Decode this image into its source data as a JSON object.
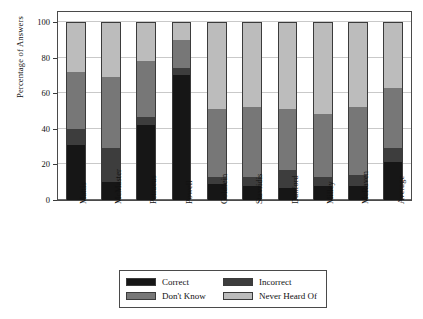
{
  "chart_data": {
    "type": "bar",
    "subtype": "stacked-bar-100",
    "title": "",
    "xlabel": "",
    "ylabel": "Percentage of Answers",
    "ylim": [
      0,
      100
    ],
    "yticks": [
      0,
      20,
      40,
      60,
      80,
      100
    ],
    "ytick_labels": [
      "0",
      "20",
      "40",
      "60",
      "80",
      "100"
    ],
    "grid": true,
    "legend_position": "bottom",
    "categories": [
      "Mattis",
      "McMaster",
      "Petraeus",
      "Powell",
      "Goldfein",
      "Stavridis",
      "Dunford",
      "Milley",
      "McRaven",
      "Average"
    ],
    "series": [
      {
        "name": "Correct",
        "color": "#161616",
        "values": [
          31,
          10,
          42,
          70.5,
          9,
          8,
          7,
          8,
          8,
          21.5
        ]
      },
      {
        "name": "Incorrect",
        "color": "#3d3d3d",
        "values": [
          9,
          19.5,
          4.5,
          3.5,
          4,
          5,
          10,
          5,
          6,
          7.5
        ]
      },
      {
        "name": "Don't Know",
        "color": "#777777",
        "values": [
          32,
          39.5,
          31.5,
          16,
          38,
          39.5,
          34,
          35.5,
          38.5,
          34
        ]
      },
      {
        "name": "Never Heard Of",
        "color": "#bcbcbc",
        "values": [
          28,
          31,
          22,
          10,
          49,
          47.5,
          49,
          51.5,
          47.5,
          37
        ]
      }
    ],
    "cumulative_tops": {
      "Mattis": [
        31,
        40,
        72,
        100
      ],
      "McMaster": [
        10,
        29.5,
        69,
        100
      ],
      "Petraeus": [
        42,
        46.5,
        78,
        100
      ],
      "Powell": [
        70.5,
        74,
        90,
        100
      ],
      "Goldfein": [
        9,
        13,
        51,
        100
      ],
      "Stavridis": [
        8,
        13,
        52.5,
        100
      ],
      "Dunford": [
        7,
        17,
        51,
        100
      ],
      "Milley": [
        8,
        13,
        48.5,
        100
      ],
      "McRaven": [
        8,
        14,
        52.5,
        100
      ],
      "Average": [
        21.5,
        29,
        63,
        100
      ]
    }
  },
  "legend": {
    "entries": [
      {
        "label": "Correct",
        "color": "#161616"
      },
      {
        "label": "Incorrect",
        "color": "#3d3d3d"
      },
      {
        "label": "Don't Know",
        "color": "#777777"
      },
      {
        "label": "Never Heard Of",
        "color": "#bcbcbc"
      }
    ]
  },
  "axes": {
    "y_title": "Percentage of Answers"
  }
}
